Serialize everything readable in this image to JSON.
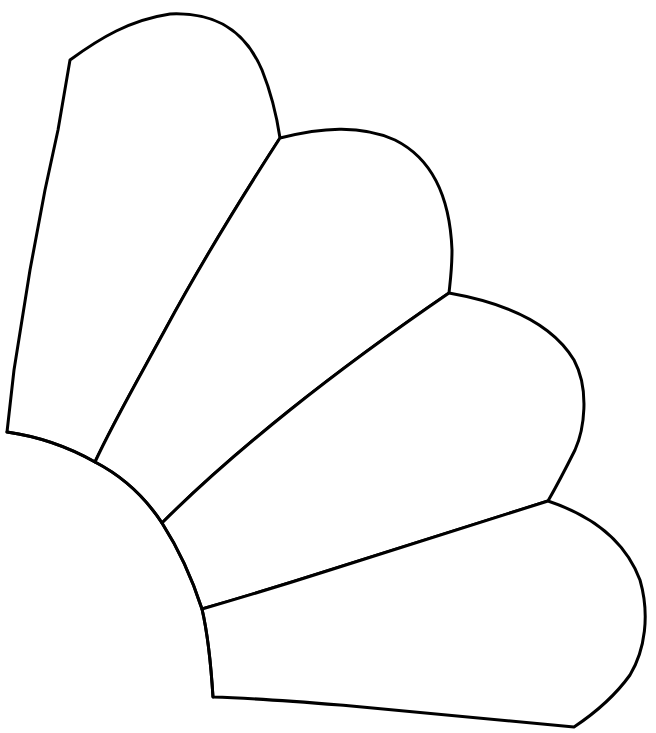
{
  "diagram": {
    "type": "line-drawing",
    "colors": {
      "stroke": "#000000",
      "fill": "#ffffff",
      "background": "#ffffff"
    },
    "pieces": [
      {
        "id": "petal-1",
        "label": ""
      },
      {
        "id": "petal-2",
        "label": ""
      },
      {
        "id": "petal-3",
        "label": ""
      },
      {
        "id": "petal-4",
        "label": ""
      },
      {
        "id": "base-quarter-circle",
        "label": ""
      }
    ]
  }
}
